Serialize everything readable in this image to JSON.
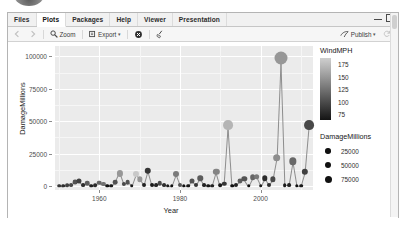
{
  "window": {
    "tabs": [
      {
        "label": "Files",
        "active": false
      },
      {
        "label": "Plots",
        "active": true
      },
      {
        "label": "Packages",
        "active": false
      },
      {
        "label": "Help",
        "active": false
      },
      {
        "label": "Viewer",
        "active": false
      },
      {
        "label": "Presentation",
        "active": false
      }
    ],
    "minimize_label": "minimize",
    "maximize_label": "maximize"
  },
  "toolbar": {
    "back_label": "",
    "forward_label": "",
    "zoom_label": "Zoom",
    "export_label": "Export",
    "export_caret": "▾",
    "remove_label": "",
    "clear_label": "",
    "publish_label": "Publish",
    "publish_caret": "▾",
    "refresh_label": ""
  },
  "chart_data": {
    "type": "scatter",
    "title": "",
    "xlabel": "Year",
    "ylabel": "DamageMillions",
    "xlim": [
      1949,
      2013
    ],
    "ylim": [
      -3000,
      108000
    ],
    "xticks": [
      1960,
      1980,
      2000
    ],
    "xticklabels": [
      "1960",
      "1980",
      "2000"
    ],
    "yticks": [
      0,
      25000,
      50000,
      75000,
      100000
    ],
    "yticklabels": [
      "0",
      "25000",
      "50000",
      "75000",
      "100000"
    ],
    "grid": true,
    "grid_color": "#ffffff",
    "panel_background": "#ebebeb",
    "connected_by_line": true,
    "line_color": "#8d8d8d",
    "legends": [
      {
        "kind": "colorbar",
        "title": "WindMPH",
        "ticks": [
          175,
          150,
          125,
          100,
          75
        ],
        "ticklabels": [
          "175",
          "150",
          "125",
          "100",
          "75"
        ],
        "low_color": "#141414",
        "high_color": "#cfcfcf",
        "position": "right-top"
      },
      {
        "kind": "size",
        "title": "DamageMillions",
        "breaks": [
          25000,
          50000,
          75000
        ],
        "breaklabels": [
          "25000",
          "50000",
          "75000"
        ],
        "dot_color": "#111111",
        "position": "right-bottom"
      }
    ],
    "points": [
      {
        "x": 1950,
        "y": 400,
        "wind": 100,
        "size": 300
      },
      {
        "x": 1951,
        "y": 300,
        "wind": 95,
        "size": 300
      },
      {
        "x": 1952,
        "y": 500,
        "wind": 105,
        "size": 400
      },
      {
        "x": 1953,
        "y": 900,
        "wind": 110,
        "size": 600
      },
      {
        "x": 1954,
        "y": 3200,
        "wind": 115,
        "size": 2600
      },
      {
        "x": 1955,
        "y": 4200,
        "wind": 105,
        "size": 3400
      },
      {
        "x": 1956,
        "y": 600,
        "wind": 95,
        "size": 500
      },
      {
        "x": 1957,
        "y": 2400,
        "wind": 120,
        "size": 1900
      },
      {
        "x": 1958,
        "y": 400,
        "wind": 90,
        "size": 300
      },
      {
        "x": 1959,
        "y": 500,
        "wind": 95,
        "size": 400
      },
      {
        "x": 1960,
        "y": 2600,
        "wind": 125,
        "size": 2100
      },
      {
        "x": 1961,
        "y": 1400,
        "wind": 130,
        "size": 1100
      },
      {
        "x": 1962,
        "y": 200,
        "wind": 80,
        "size": 200
      },
      {
        "x": 1963,
        "y": 300,
        "wind": 85,
        "size": 300
      },
      {
        "x": 1964,
        "y": 2800,
        "wind": 115,
        "size": 2300
      },
      {
        "x": 1965,
        "y": 9800,
        "wind": 150,
        "size": 8000
      },
      {
        "x": 1966,
        "y": 1500,
        "wind": 110,
        "size": 1200
      },
      {
        "x": 1967,
        "y": 3100,
        "wind": 115,
        "size": 2500
      },
      {
        "x": 1968,
        "y": 400,
        "wind": 85,
        "size": 300
      },
      {
        "x": 1969,
        "y": 9200,
        "wind": 175,
        "size": 7500
      },
      {
        "x": 1970,
        "y": 5200,
        "wind": 150,
        "size": 4300
      },
      {
        "x": 1971,
        "y": 800,
        "wind": 90,
        "size": 700
      },
      {
        "x": 1972,
        "y": 12000,
        "wind": 100,
        "size": 9800
      },
      {
        "x": 1973,
        "y": 900,
        "wind": 85,
        "size": 700
      },
      {
        "x": 1974,
        "y": 600,
        "wind": 90,
        "size": 500
      },
      {
        "x": 1975,
        "y": 2400,
        "wind": 110,
        "size": 2000
      },
      {
        "x": 1976,
        "y": 700,
        "wind": 95,
        "size": 600
      },
      {
        "x": 1977,
        "y": 300,
        "wind": 85,
        "size": 300
      },
      {
        "x": 1978,
        "y": 200,
        "wind": 80,
        "size": 200
      },
      {
        "x": 1979,
        "y": 9000,
        "wind": 135,
        "size": 7300
      },
      {
        "x": 1980,
        "y": 1100,
        "wind": 115,
        "size": 900
      },
      {
        "x": 1981,
        "y": 200,
        "wind": 80,
        "size": 200
      },
      {
        "x": 1982,
        "y": 300,
        "wind": 85,
        "size": 300
      },
      {
        "x": 1983,
        "y": 4200,
        "wind": 115,
        "size": 3400
      },
      {
        "x": 1984,
        "y": 1000,
        "wind": 100,
        "size": 800
      },
      {
        "x": 1985,
        "y": 6000,
        "wind": 120,
        "size": 4900
      },
      {
        "x": 1986,
        "y": 700,
        "wind": 90,
        "size": 600
      },
      {
        "x": 1987,
        "y": 300,
        "wind": 85,
        "size": 300
      },
      {
        "x": 1988,
        "y": 400,
        "wind": 90,
        "size": 300
      },
      {
        "x": 1989,
        "y": 11000,
        "wind": 140,
        "size": 9000
      },
      {
        "x": 1990,
        "y": 500,
        "wind": 85,
        "size": 400
      },
      {
        "x": 1991,
        "y": 1800,
        "wind": 100,
        "size": 1500
      },
      {
        "x": 1992,
        "y": 47000,
        "wind": 165,
        "size": 38000
      },
      {
        "x": 1993,
        "y": 300,
        "wind": 80,
        "size": 300
      },
      {
        "x": 1994,
        "y": 1100,
        "wind": 90,
        "size": 900
      },
      {
        "x": 1995,
        "y": 3800,
        "wind": 120,
        "size": 3100
      },
      {
        "x": 1996,
        "y": 5400,
        "wind": 115,
        "size": 4400
      },
      {
        "x": 1997,
        "y": 200,
        "wind": 80,
        "size": 200
      },
      {
        "x": 1998,
        "y": 6800,
        "wind": 125,
        "size": 5500
      },
      {
        "x": 1999,
        "y": 7200,
        "wind": 135,
        "size": 5900
      },
      {
        "x": 2000,
        "y": 400,
        "wind": 85,
        "size": 300
      },
      {
        "x": 2001,
        "y": 6200,
        "wind": 95,
        "size": 5000
      },
      {
        "x": 2002,
        "y": 1000,
        "wind": 95,
        "size": 800
      },
      {
        "x": 2003,
        "y": 5200,
        "wind": 110,
        "size": 4300
      },
      {
        "x": 2004,
        "y": 22000,
        "wind": 145,
        "size": 18000
      },
      {
        "x": 2005,
        "y": 99000,
        "wind": 150,
        "size": 81000
      },
      {
        "x": 2006,
        "y": 500,
        "wind": 85,
        "size": 400
      },
      {
        "x": 2007,
        "y": 600,
        "wind": 90,
        "size": 500
      },
      {
        "x": 2008,
        "y": 19000,
        "wind": 125,
        "size": 15500
      },
      {
        "x": 2009,
        "y": 200,
        "wind": 80,
        "size": 200
      },
      {
        "x": 2010,
        "y": 300,
        "wind": 85,
        "size": 300
      },
      {
        "x": 2011,
        "y": 11000,
        "wind": 105,
        "size": 9000
      },
      {
        "x": 2012,
        "y": 47000,
        "wind": 110,
        "size": 38000
      }
    ]
  }
}
